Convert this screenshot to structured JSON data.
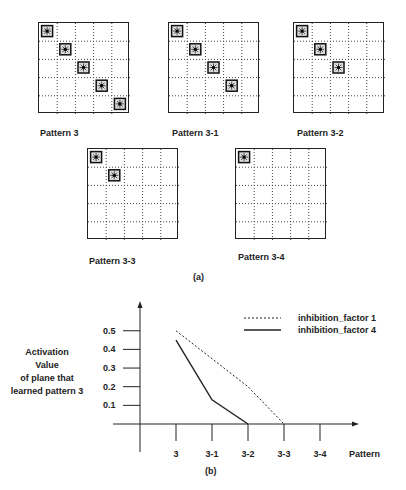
{
  "figure_a": {
    "caption": "(a)",
    "grid_size": 5,
    "patterns": [
      {
        "label": "Pattern 3",
        "active_cells": [
          [
            0,
            0
          ],
          [
            1,
            1
          ],
          [
            2,
            2
          ],
          [
            3,
            3
          ],
          [
            4,
            4
          ]
        ],
        "x": 38,
        "y": 22,
        "label_x": 40,
        "label_y": 128
      },
      {
        "label": "Pattern 3-1",
        "active_cells": [
          [
            0,
            0
          ],
          [
            1,
            1
          ],
          [
            2,
            2
          ],
          [
            3,
            3
          ]
        ],
        "x": 168,
        "y": 22,
        "label_x": 172,
        "label_y": 128
      },
      {
        "label": "Pattern 3-2",
        "active_cells": [
          [
            0,
            0
          ],
          [
            1,
            1
          ],
          [
            2,
            2
          ]
        ],
        "x": 293,
        "y": 22,
        "label_x": 297,
        "label_y": 128
      },
      {
        "label": "Pattern 3-3",
        "active_cells": [
          [
            0,
            0
          ],
          [
            1,
            1
          ]
        ],
        "x": 87,
        "y": 148,
        "label_x": 89,
        "label_y": 256
      },
      {
        "label": "Pattern 3-4",
        "active_cells": [
          [
            0,
            0
          ]
        ],
        "x": 235,
        "y": 148,
        "label_x": 238,
        "label_y": 252
      }
    ]
  },
  "figure_b": {
    "caption": "(b)",
    "ylabel_lines": [
      "Activation",
      "Value",
      "of plane that",
      "learned pattern 3"
    ],
    "xlabel": "Pattern"
  },
  "chart_data": {
    "type": "line",
    "title": "",
    "xlabel": "Pattern",
    "ylabel": "Activation Value of plane that learned pattern 3",
    "categories": [
      "3",
      "3-1",
      "3-2",
      "3-3",
      "3-4"
    ],
    "y_ticks": [
      0.1,
      0.2,
      0.3,
      0.4,
      0.5
    ],
    "ylim": [
      0,
      0.6
    ],
    "grid": false,
    "legend_position": "top-right",
    "series": [
      {
        "name": "inhibition_factor 1",
        "style": "dashed",
        "values": [
          0.5,
          0.35,
          0.2,
          0.0,
          null
        ]
      },
      {
        "name": "inhibition_factor 4",
        "style": "solid",
        "values": [
          0.45,
          0.13,
          0.0,
          null,
          null
        ]
      }
    ]
  }
}
